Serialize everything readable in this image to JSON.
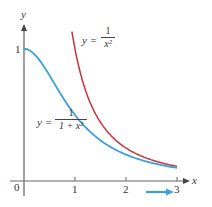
{
  "chart_data": {
    "type": "line",
    "title": "",
    "xlabel": "x",
    "ylabel": "y",
    "x_ticks": [
      "0",
      "1",
      "2",
      "3"
    ],
    "y_ticks": [
      "1"
    ],
    "xlim": [
      0,
      3
    ],
    "ylim": [
      0,
      1.2
    ],
    "grid": false,
    "series": [
      {
        "name": "y = 1/(1 + x^2)",
        "color": "#3aa0d8",
        "x": [
          0,
          0.25,
          0.5,
          0.75,
          1,
          1.5,
          2,
          2.5,
          3
        ],
        "y": [
          1,
          0.941,
          0.8,
          0.64,
          0.5,
          0.308,
          0.2,
          0.138,
          0.1
        ]
      },
      {
        "name": "y = 1/x^2",
        "color": "#c8323c",
        "x": [
          0.94,
          1,
          1.25,
          1.5,
          2,
          2.5,
          3
        ],
        "y": [
          1.13,
          1,
          0.64,
          0.444,
          0.25,
          0.16,
          0.111
        ]
      }
    ],
    "annotations": [
      "blue arrow pointing right below x-axis between 2 and 3"
    ]
  },
  "labels": {
    "y_axis": "y",
    "x_axis": "x",
    "origin": "0",
    "x1": "1",
    "x2": "2",
    "x3": "3",
    "y1": "1",
    "red_eq_lhs": "y =",
    "red_num": "1",
    "red_den": "x²",
    "blue_eq_lhs": "y =",
    "blue_num": "1",
    "blue_den": "1 + x²"
  },
  "colors": {
    "blue": "#3aa0d8",
    "red": "#c8323c",
    "axis": "#555555"
  }
}
